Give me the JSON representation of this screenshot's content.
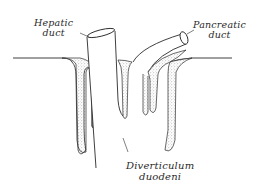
{
  "figure": {
    "type": "anatomical line drawing",
    "labels": {
      "hepatic_duct": {
        "line1": "Hepatic",
        "line2": "duct"
      },
      "pancreatic_duct": {
        "line1": "Pancreatic",
        "line2": "duct"
      },
      "diverticulum": {
        "line1": "Diverticulum",
        "line2": "duodeni"
      }
    },
    "colors": {
      "ink": "#2a2a2a",
      "stipple": "#8a8a8a",
      "background": "#ffffff"
    }
  }
}
